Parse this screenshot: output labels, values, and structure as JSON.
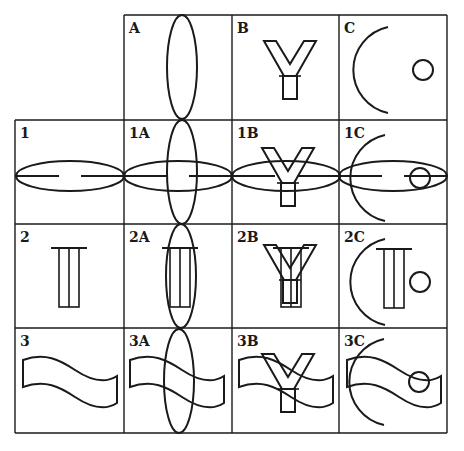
{
  "figure": {
    "columns": [
      {
        "label": "A",
        "shape": "vertical-ellipse"
      },
      {
        "label": "B",
        "shape": "y-letter-outline"
      },
      {
        "label": "C",
        "shape": "arc-with-small-circle"
      }
    ],
    "rows": [
      {
        "label": "1",
        "shape": "horizontal-ellipse-with-dashed-line"
      },
      {
        "label": "2",
        "shape": "barred-column"
      },
      {
        "label": "3",
        "shape": "wavy-banner"
      }
    ],
    "cells": [
      {
        "label": "1A"
      },
      {
        "label": "1B"
      },
      {
        "label": "1C"
      },
      {
        "label": "2A"
      },
      {
        "label": "2B"
      },
      {
        "label": "2C"
      },
      {
        "label": "3A"
      },
      {
        "label": "3B"
      },
      {
        "label": "3C"
      }
    ],
    "stroke_color": "#1a1a1a",
    "background_color": "#ffffff"
  }
}
